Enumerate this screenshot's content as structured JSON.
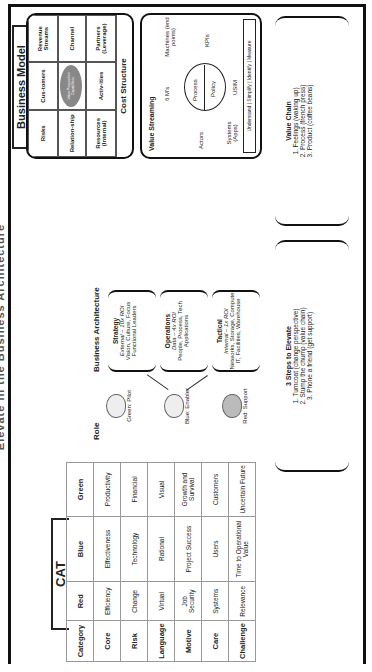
{
  "title": "Elevate in the Business Architecture",
  "cat": {
    "label": "CAT",
    "headers": [
      "Category",
      "Red",
      "Blue",
      "Green"
    ],
    "rows": [
      {
        "category": "Core",
        "red": "Efficiency",
        "blue": "Effectiveness",
        "green": "Productivity"
      },
      {
        "category": "Risk",
        "red": "Change",
        "blue": "Technology",
        "green": "Financial"
      },
      {
        "category": "Language",
        "red": "Virtual",
        "blue": "Rational",
        "green": "Visual"
      },
      {
        "category": "Motive",
        "red": "Job Security",
        "blue": "Project Success",
        "green": "Growth and Survival"
      },
      {
        "category": "Care",
        "red": "Systems",
        "blue": "Users",
        "green": "Customers"
      },
      {
        "category": "Challenge",
        "red": "Relevance",
        "blue": "Time to Operational Value",
        "green": "Uncertain Future"
      }
    ]
  },
  "role": {
    "title": "Role",
    "items": [
      {
        "label": "Green: Pilot",
        "icon": "sheep-icon"
      },
      {
        "label": "Blue: Enabler",
        "icon": "sheep-icon"
      },
      {
        "label": "Red: Support",
        "icon": "sheep-icon"
      }
    ]
  },
  "business_architecture": {
    "title": "Business Architecture",
    "boxes": [
      {
        "name": "Strategy",
        "roi": "External – 10x ROI",
        "line1": "Vision, Culture, Focus",
        "line2": "Functional Leaders"
      },
      {
        "name": "Operations",
        "roi": "Data – 4x ROI",
        "line1": "People, Process, Tech",
        "line2": "Applications"
      },
      {
        "name": "Tactical",
        "roi": "Internal – 1x ROI",
        "line1": "Networks, Storage, Compute",
        "line2": "IT, Facilities, Warehouse"
      }
    ]
  },
  "business_model": {
    "label": "Business Model",
    "cells": [
      "Risks",
      "Cus-tomers",
      "Revenue Streams",
      "Relation-ship",
      "",
      "Channel",
      "Resources (Internal)",
      "Activ-ities",
      "Partners (Leverage)"
    ],
    "value_proposition": "Value Proposition",
    "capabilities": "Capabilities",
    "cost_structure": "Cost Structure"
  },
  "value_streaming": {
    "title": "Value Streaming",
    "six_ms": "6 M's",
    "actors": "Actors",
    "machines": "Machines (end points)",
    "process": "Process",
    "policy": "Policy",
    "systems": "Systems (Apps)",
    "kpis": "KPIs",
    "usim": "USIM",
    "footer": "Understand | Simplify | Identify | Measure"
  },
  "steps": {
    "title": "3 Steps to Elevate",
    "items": [
      "1. Turncoat (change perspective)",
      "2. Stump the chump (value chain)",
      "3. Phone a friend (get support)"
    ]
  },
  "value_chain": {
    "title": "Value Chain",
    "items": [
      "1. Feelings (waking up)",
      "2. Process (french press)",
      "3. Product (coffee beans)"
    ]
  }
}
